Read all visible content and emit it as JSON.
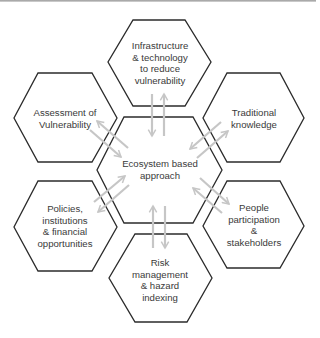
{
  "diagram": {
    "type": "hexagon-cluster",
    "colors": {
      "hex_stroke": "#2b2b2b",
      "hex_fill": "#ffffff",
      "arrow": "#c6c6c6",
      "text": "#3a3a3a"
    },
    "center": {
      "id": "ecosystem",
      "label": "Ecosystem based\napproach"
    },
    "nodes": [
      {
        "id": "infrastructure",
        "position": "top",
        "label": "Infrastructure\n& technology\nto reduce\nvulnerability"
      },
      {
        "id": "assessment",
        "position": "top-left",
        "label": "Assessment of\nVulnerability"
      },
      {
        "id": "traditional",
        "position": "top-right",
        "label": "Traditional\nknowledge"
      },
      {
        "id": "policies",
        "position": "bottom-left",
        "label": "Policies,\ninstitutions\n& financial\nopportunities"
      },
      {
        "id": "people",
        "position": "bottom-right",
        "label": "People\nparticipation\n&\nstakeholders"
      },
      {
        "id": "risk",
        "position": "bottom",
        "label": "Risk\nmanagement\n& hazard\nindexing"
      }
    ],
    "edges": [
      {
        "from": "ecosystem",
        "to": "infrastructure",
        "direction": "bidirectional"
      },
      {
        "from": "ecosystem",
        "to": "assessment",
        "direction": "bidirectional"
      },
      {
        "from": "ecosystem",
        "to": "traditional",
        "direction": "bidirectional"
      },
      {
        "from": "ecosystem",
        "to": "policies",
        "direction": "bidirectional"
      },
      {
        "from": "ecosystem",
        "to": "people",
        "direction": "bidirectional"
      },
      {
        "from": "ecosystem",
        "to": "risk",
        "direction": "bidirectional"
      }
    ]
  }
}
